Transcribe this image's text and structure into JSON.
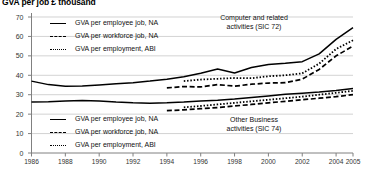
{
  "chart_data": {
    "type": "line",
    "title": "GVA per job £ thousand",
    "xlabel": "",
    "ylabel": "",
    "xlim": [
      1986,
      2005
    ],
    "ylim": [
      0,
      70
    ],
    "yticks": [
      0,
      10,
      20,
      30,
      40,
      50,
      60,
      70
    ],
    "xticks": [
      1986,
      1988,
      1990,
      1992,
      1994,
      1996,
      1998,
      2000,
      2002,
      2004,
      2005
    ],
    "grid": true,
    "legend_position": "inside-upper-left and inside-lower-left",
    "annotations": [
      {
        "text_line1": "Computer and related",
        "text_line2": "activities (SIC 72)"
      },
      {
        "text_line1": "Other Business",
        "text_line2": "activities (SIC 74)"
      }
    ],
    "groups": [
      {
        "name": "Computer and related activities (SIC 72)",
        "series": [
          {
            "name": "GVA per employee job, NA",
            "style": "solid",
            "x": [
              1986,
              1987,
              1988,
              1989,
              1990,
              1991,
              1992,
              1993,
              1994,
              1995,
              1996,
              1997,
              1998,
              1999,
              2000,
              2001,
              2002,
              2003,
              2004,
              2005
            ],
            "values": [
              37.0,
              35.2,
              34.4,
              34.5,
              35.0,
              35.6,
              36.2,
              37.0,
              38.0,
              39.2,
              41.0,
              43.2,
              41.2,
              44.0,
              45.6,
              46.2,
              47.0,
              51.0,
              58.5,
              64.5
            ]
          },
          {
            "name": "GVA per workforce job, NA",
            "style": "dashed",
            "x": [
              1994,
              1995,
              1996,
              1997,
              1998,
              1999,
              2000,
              2001,
              2002,
              2003,
              2004,
              2005
            ],
            "values": [
              33.5,
              34.2,
              34.0,
              35.2,
              34.4,
              35.4,
              36.0,
              36.2,
              38.0,
              43.0,
              50.0,
              55.0
            ]
          },
          {
            "name": "GVA per employment, ABI",
            "style": "dotted",
            "x": [
              1995,
              1996,
              1997,
              1998,
              1999,
              2000,
              2001,
              2002,
              2003,
              2004,
              2005
            ],
            "values": [
              37.0,
              37.8,
              38.2,
              38.6,
              38.5,
              39.5,
              40.0,
              41.0,
              46.0,
              53.5,
              58.0
            ]
          }
        ]
      },
      {
        "name": "Other Business activities (SIC 74)",
        "series": [
          {
            "name": "GVA per employee job, NA",
            "style": "solid",
            "x": [
              1986,
              1987,
              1988,
              1989,
              1990,
              1991,
              1992,
              1993,
              1994,
              1995,
              1996,
              1997,
              1998,
              1999,
              2000,
              2001,
              2002,
              2003,
              2004,
              2005
            ],
            "values": [
              26.2,
              26.4,
              26.8,
              27.0,
              26.8,
              26.2,
              25.8,
              25.6,
              25.8,
              26.2,
              26.8,
              27.2,
              27.8,
              28.6,
              29.4,
              30.2,
              30.8,
              31.4,
              32.2,
              33.2
            ]
          },
          {
            "name": "GVA per workforce job, NA",
            "style": "dashed",
            "x": [
              1994,
              1995,
              1996,
              1997,
              1998,
              1999,
              2000,
              2001,
              2002,
              2003,
              2004,
              2005
            ],
            "values": [
              21.8,
              22.2,
              22.8,
              23.4,
              24.2,
              25.0,
              25.8,
              26.6,
              27.4,
              28.2,
              29.0,
              30.0
            ]
          },
          {
            "name": "GVA per employment, ABI",
            "style": "dotted",
            "x": [
              1995,
              1996,
              1997,
              1998,
              1999,
              2000,
              2001,
              2002,
              2003,
              2004,
              2005
            ],
            "values": [
              23.5,
              24.2,
              25.0,
              25.8,
              26.6,
              27.4,
              28.2,
              29.0,
              30.0,
              31.0,
              32.0
            ]
          }
        ]
      }
    ]
  },
  "legend_top": {
    "items": [
      {
        "label": "GVA per employee job, NA",
        "style": "solid"
      },
      {
        "label": "GVA per workforce job, NA",
        "style": "dashed"
      },
      {
        "label": "GVA per employment, ABI",
        "style": "dotted"
      }
    ]
  },
  "legend_bottom": {
    "items": [
      {
        "label": "GVA per employee job, NA",
        "style": "solid"
      },
      {
        "label": "GVA per workforce job, NA",
        "style": "dashed"
      },
      {
        "label": "GVA per employment, ABI",
        "style": "dotted"
      }
    ]
  },
  "colors": {
    "line": "#000000",
    "grid": "#bfbfbf",
    "axis": "#808080",
    "text": "#111111"
  }
}
